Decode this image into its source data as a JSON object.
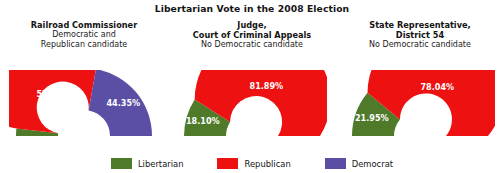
{
  "chart_data": {
    "type": "pie",
    "title": "Libertarian Vote in the 2008 Election",
    "xlabel": "",
    "ylabel": "",
    "legend_position": "bottom",
    "grid": false,
    "note": "Three half-donut gauge charts; each sums to ~100% of the vote in that race.",
    "legend": [
      {
        "name": "Libertarian",
        "color": "#4f7a2a"
      },
      {
        "name": "Republican",
        "color": "#ee1111"
      },
      {
        "name": "Democrat",
        "color": "#5b4ea5"
      }
    ],
    "panels": [
      {
        "heading": "Railroad Commissioner",
        "subtitle": "Democratic and\nRepublican candidate",
        "slices": [
          {
            "party": "Libertarian",
            "label": "3.51%",
            "value": 3.51,
            "color": "#4f7a2a",
            "label_placement": "outside"
          },
          {
            "party": "Republican",
            "label": "52.13%",
            "value": 52.13,
            "color": "#ee1111",
            "label_placement": "inside"
          },
          {
            "party": "Democrat",
            "label": "44.35%",
            "value": 44.35,
            "color": "#5b4ea5",
            "label_placement": "inside"
          }
        ]
      },
      {
        "heading": "Judge,\nCourt of Criminal Appeals",
        "subtitle": "No Democratic candidate",
        "slices": [
          {
            "party": "Libertarian",
            "label": "18.10%",
            "value": 18.1,
            "color": "#4f7a2a",
            "label_placement": "inside"
          },
          {
            "party": "Republican",
            "label": "81.89%",
            "value": 81.89,
            "color": "#ee1111",
            "label_placement": "inside"
          }
        ]
      },
      {
        "heading": "State Representative,\nDistrict 54",
        "subtitle": "No Democratic candidate",
        "slices": [
          {
            "party": "Libertarian",
            "label": "21.95%",
            "value": 21.95,
            "color": "#4f7a2a",
            "label_placement": "inside"
          },
          {
            "party": "Republican",
            "label": "78.04%",
            "value": 78.04,
            "color": "#ee1111",
            "label_placement": "inside"
          }
        ]
      }
    ]
  }
}
